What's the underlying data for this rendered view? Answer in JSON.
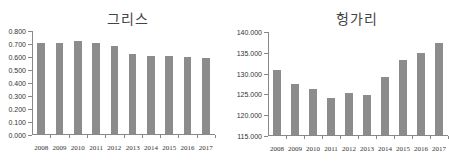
{
  "chart_data": [
    {
      "type": "bar",
      "title": "그리스",
      "xlabel": "",
      "ylabel": "",
      "categories": [
        "2008",
        "2009",
        "2010",
        "2011",
        "2012",
        "2013",
        "2014",
        "2015",
        "2016",
        "2017"
      ],
      "values": [
        0.71,
        0.705,
        0.72,
        0.71,
        0.685,
        0.625,
        0.605,
        0.605,
        0.6,
        0.59
      ],
      "ylim": [
        0,
        0.8
      ],
      "yticks": [
        "0.000",
        "0.100",
        "0.200",
        "0.300",
        "0.400",
        "0.500",
        "0.600",
        "0.700",
        "0.800"
      ],
      "grid": false,
      "legend": null,
      "bar_color": "#8c8c8c"
    },
    {
      "type": "bar",
      "title": "헝가리",
      "xlabel": "",
      "ylabel": "",
      "categories": [
        "2008",
        "2009",
        "2010",
        "2011",
        "2012",
        "2013",
        "2014",
        "2015",
        "2016",
        "2017"
      ],
      "values": [
        130900,
        127500,
        126200,
        124100,
        125400,
        124800,
        129200,
        133200,
        134900,
        137400
      ],
      "ylim": [
        115000,
        140000
      ],
      "yticks": [
        "115.000",
        "120.000",
        "125.000",
        "130.000",
        "135.000",
        "140.000"
      ],
      "grid": false,
      "legend": null,
      "bar_color": "#8c8c8c"
    }
  ]
}
